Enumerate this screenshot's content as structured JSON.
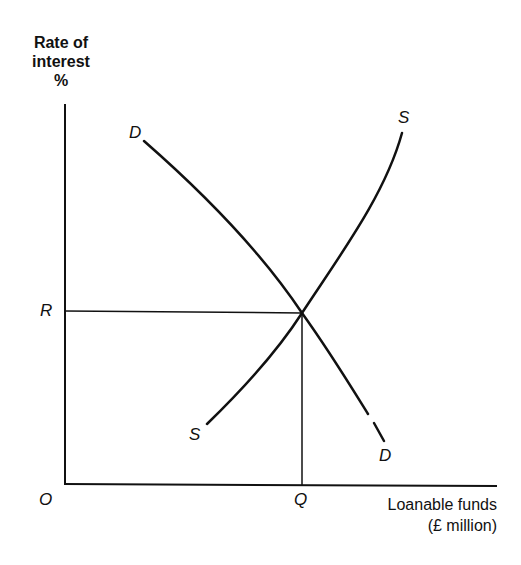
{
  "diagram": {
    "type": "supply-demand",
    "y_axis": {
      "title_lines": [
        "Rate of",
        "interest",
        "%"
      ]
    },
    "x_axis": {
      "title_lines": [
        "Loanable funds",
        "(£ million)"
      ]
    },
    "origin_label": "O",
    "equilibrium": {
      "rate_label": "R",
      "quantity_label": "Q"
    },
    "curves": {
      "demand": {
        "start_label": "D",
        "end_label": "D",
        "direction": "downward-sloping"
      },
      "supply": {
        "start_label": "S",
        "end_label": "S",
        "direction": "upward-sloping"
      }
    },
    "colors": {
      "ink": "#111111",
      "background": "#ffffff"
    }
  }
}
